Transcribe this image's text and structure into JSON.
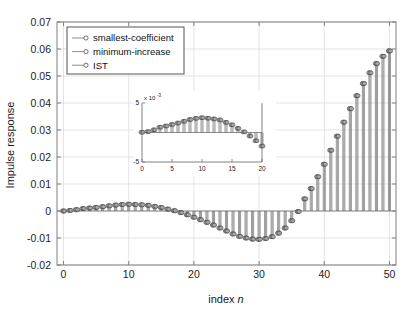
{
  "figure": {
    "background_color": "#ffffff",
    "axes_color": "#808080",
    "grid_color": "#d9d9d9",
    "stem_color": "#6e6e6e",
    "marker_edge_color": "#4d4d4d",
    "marker_face_color": "#b3b3b3"
  },
  "chart_data": {
    "type": "line",
    "plot_style": "stem",
    "title": "",
    "xlabel": "index n",
    "ylabel": "Impulse response",
    "xlim": [
      -1,
      51
    ],
    "ylim": [
      -0.02,
      0.07
    ],
    "xticks": [
      0,
      10,
      20,
      30,
      40,
      50
    ],
    "yticks": [
      -0.02,
      -0.01,
      0,
      0.01,
      0.02,
      0.03,
      0.04,
      0.05,
      0.06,
      0.07
    ],
    "xticklabels": [
      "0",
      "10",
      "20",
      "30",
      "40",
      "50"
    ],
    "yticklabels": [
      "-0.02",
      "-0.01",
      "0",
      "0.01",
      "0.02",
      "0.03",
      "0.04",
      "0.05",
      "0.06",
      "0.07"
    ],
    "grid": true,
    "legend_position": "upper left",
    "legend": [
      "smallest-coefficient",
      "minimum-increase",
      "IST"
    ],
    "x": [
      0,
      1,
      2,
      3,
      4,
      5,
      6,
      7,
      8,
      9,
      10,
      11,
      12,
      13,
      14,
      15,
      16,
      17,
      18,
      19,
      20,
      21,
      22,
      23,
      24,
      25,
      26,
      27,
      28,
      29,
      30,
      31,
      32,
      33,
      34,
      35,
      36,
      37,
      38,
      39,
      40,
      41,
      42,
      43,
      44,
      45,
      46,
      47,
      48,
      49,
      50
    ],
    "series": [
      {
        "name": "smallest-coefficient",
        "values": [
          0.0,
          0.0002,
          0.0005,
          0.0009,
          0.0011,
          0.0013,
          0.0016,
          0.0019,
          0.0022,
          0.0024,
          0.0025,
          0.0024,
          0.0023,
          0.0021,
          0.0017,
          0.0013,
          0.0007,
          0.0001,
          -0.0006,
          -0.0014,
          -0.0023,
          -0.0032,
          -0.0042,
          -0.0052,
          -0.0063,
          -0.0074,
          -0.0085,
          -0.0094,
          -0.01,
          -0.0104,
          -0.0105,
          -0.0102,
          -0.0095,
          -0.0082,
          -0.0063,
          -0.0036,
          -0.0002,
          0.0045,
          0.0083,
          0.0127,
          0.0173,
          0.0225,
          0.0277,
          0.0329,
          0.0379,
          0.0427,
          0.0472,
          0.0512,
          0.0546,
          0.0573,
          0.0593
        ]
      },
      {
        "name": "minimum-increase",
        "values": [
          0.0,
          0.0002,
          0.0005,
          0.0009,
          0.0011,
          0.0013,
          0.0016,
          0.0019,
          0.0022,
          0.0024,
          0.0025,
          0.0024,
          0.0023,
          0.0021,
          0.0017,
          0.0013,
          0.0007,
          0.0001,
          -0.0006,
          -0.0014,
          -0.0023,
          -0.0032,
          -0.0042,
          -0.0052,
          -0.0063,
          -0.0074,
          -0.0085,
          -0.0094,
          -0.01,
          -0.0104,
          -0.0105,
          -0.0102,
          -0.0095,
          -0.0082,
          -0.0063,
          -0.0036,
          -0.0002,
          0.0045,
          0.0083,
          0.0127,
          0.0173,
          0.0225,
          0.0277,
          0.0329,
          0.0379,
          0.0427,
          0.0472,
          0.0512,
          0.0546,
          0.0573,
          0.0593
        ]
      },
      {
        "name": "IST",
        "values": [
          0.0,
          0.0002,
          0.0005,
          0.0009,
          0.0011,
          0.0013,
          0.0016,
          0.0019,
          0.0022,
          0.0024,
          0.0025,
          0.0024,
          0.0023,
          0.0021,
          0.0017,
          0.0013,
          0.0007,
          0.0001,
          -0.0006,
          -0.0014,
          -0.0023,
          -0.0032,
          -0.0042,
          -0.0052,
          -0.0063,
          -0.0074,
          -0.0085,
          -0.0094,
          -0.01,
          -0.0104,
          -0.0105,
          -0.0102,
          -0.0095,
          -0.0082,
          -0.0063,
          -0.0036,
          -0.0002,
          0.0045,
          0.0083,
          0.0127,
          0.0173,
          0.0225,
          0.0277,
          0.0329,
          0.0379,
          0.0427,
          0.0472,
          0.0512,
          0.0546,
          0.0573,
          0.0593
        ]
      }
    ],
    "inset": {
      "type": "line",
      "plot_style": "stem",
      "xlim": [
        0,
        20
      ],
      "ylim": [
        -5,
        5
      ],
      "xticks": [
        0,
        5,
        10,
        15,
        20
      ],
      "yticks": [
        -5,
        5
      ],
      "xticklabels": [
        "0",
        "5",
        "10",
        "15",
        "20"
      ],
      "yticklabels": [
        "-5",
        "5"
      ],
      "exponent_label": "x 10",
      "exponent_value": "-3",
      "grid": false,
      "x": [
        0,
        1,
        2,
        3,
        4,
        5,
        6,
        7,
        8,
        9,
        10,
        11,
        12,
        13,
        14,
        15,
        16,
        17,
        18,
        19,
        20
      ],
      "values": [
        0.05,
        0.15,
        0.45,
        0.9,
        1.1,
        1.35,
        1.6,
        1.9,
        2.2,
        2.4,
        2.5,
        2.42,
        2.3,
        2.12,
        1.72,
        1.3,
        0.7,
        0.1,
        -0.6,
        -1.4,
        -2.3
      ]
    }
  }
}
